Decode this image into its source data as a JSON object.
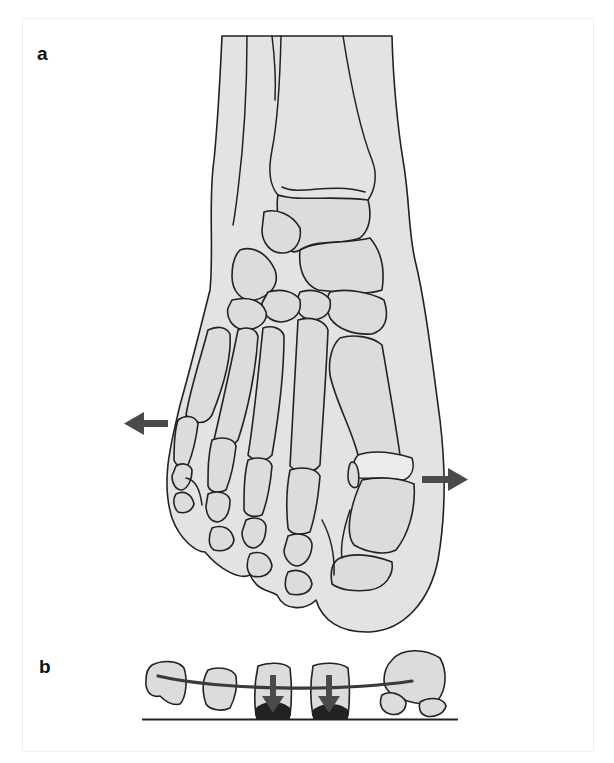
{
  "figure": {
    "panels": [
      {
        "id": "a",
        "label": "a",
        "description": "Dorsal view of foot skeleton (splayfoot / metatarsus primus varus) with arrows indicating lateral and medial spreading"
      },
      {
        "id": "b",
        "label": "b",
        "description": "Coronal view of metatarsal heads showing collapsed transverse arch with downward arrows on 2nd and 3rd metatarsal heads"
      }
    ],
    "arrows": {
      "panel_a": [
        {
          "name": "left-spread-arrow",
          "direction": "left"
        },
        {
          "name": "right-spread-arrow",
          "direction": "right"
        }
      ],
      "panel_b": [
        {
          "name": "pressure-arrow-2",
          "direction": "down"
        },
        {
          "name": "pressure-arrow-3",
          "direction": "down"
        }
      ]
    },
    "colors": {
      "bone_fill": "#dcdcdc",
      "skin_fill": "#e3e3e3",
      "outline": "#222222",
      "arrow": "#4a4a4a",
      "background": "#ffffff"
    }
  }
}
